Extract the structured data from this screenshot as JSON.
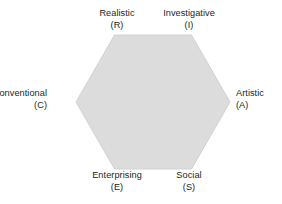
{
  "figure": {
    "background_color": "#ffffff",
    "shape": {
      "name": "hexagon",
      "fill_color": "#dcdcdc",
      "stroke_color": "#d2d2d2",
      "orientation": "flat-top"
    },
    "label_color": "#231f20"
  },
  "vertices": [
    {
      "id": "realistic",
      "name": "Realistic",
      "code": "(R)",
      "letter": "R",
      "position": "top-left"
    },
    {
      "id": "investigative",
      "name": "Investigative",
      "code": "(I)",
      "letter": "I",
      "position": "top-right"
    },
    {
      "id": "artistic",
      "name": "Artistic",
      "code": "(A)",
      "letter": "A",
      "position": "right"
    },
    {
      "id": "social",
      "name": "Social",
      "code": "(S)",
      "letter": "S",
      "position": "bottom-right"
    },
    {
      "id": "enterprising",
      "name": "Enterprising",
      "code": "(E)",
      "letter": "E",
      "position": "bottom-left"
    },
    {
      "id": "conventional",
      "name": "Conventional",
      "code": "(C)",
      "letter": "C",
      "position": "left"
    }
  ],
  "watermark": {
    "text": ""
  }
}
